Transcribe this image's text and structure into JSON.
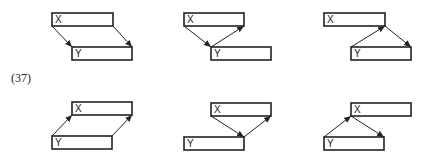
{
  "equation_label": "(37)",
  "stroke_color": "#222222",
  "panels": [
    {
      "id": "top-1",
      "x_label": "X",
      "y_label": "Y",
      "x_box": [
        52,
        13,
        61,
        13
      ],
      "y_box": [
        72,
        47,
        60,
        13
      ],
      "arrows": [
        [
          52,
          26,
          72,
          47
        ],
        [
          113,
          26,
          132,
          47
        ]
      ]
    },
    {
      "id": "top-2",
      "x_label": "X",
      "y_label": "Y",
      "x_box": [
        184,
        13,
        60,
        13
      ],
      "y_box": [
        211,
        47,
        60,
        13
      ],
      "arrows": [
        [
          184,
          26,
          211,
          47
        ],
        [
          211,
          47,
          244,
          26
        ]
      ]
    },
    {
      "id": "top-3",
      "x_label": "X",
      "y_label": "Y",
      "x_box": [
        324,
        13,
        61,
        13
      ],
      "y_box": [
        351,
        47,
        60,
        13
      ],
      "arrows": [
        [
          351,
          47,
          385,
          26
        ],
        [
          385,
          26,
          411,
          47
        ]
      ]
    },
    {
      "id": "bottom-1",
      "x_label": "X",
      "y_label": "Y",
      "x_box": [
        72,
        102,
        60,
        13
      ],
      "y_box": [
        52,
        136,
        60,
        13
      ],
      "arrows": [
        [
          52,
          136,
          72,
          115
        ],
        [
          112,
          136,
          132,
          115
        ]
      ]
    },
    {
      "id": "bottom-2",
      "x_label": "X",
      "y_label": "Y",
      "x_box": [
        211,
        103,
        60,
        13
      ],
      "y_box": [
        184,
        137,
        60,
        13
      ],
      "arrows": [
        [
          211,
          116,
          244,
          137
        ],
        [
          244,
          137,
          271,
          116
        ]
      ]
    },
    {
      "id": "bottom-3",
      "x_label": "X",
      "y_label": "Y",
      "x_box": [
        351,
        103,
        60,
        13
      ],
      "y_box": [
        324,
        137,
        60,
        13
      ],
      "arrows": [
        [
          324,
          137,
          351,
          116
        ],
        [
          351,
          116,
          384,
          137
        ]
      ]
    }
  ]
}
